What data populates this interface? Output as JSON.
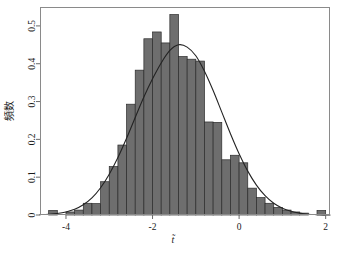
{
  "chart_data": {
    "type": "bar",
    "title": "",
    "subtitle": "",
    "xlabel": "t̃",
    "ylabel": "頻数",
    "xlim": [
      -4.6,
      2.1
    ],
    "ylim": [
      0,
      0.55
    ],
    "xticks": [
      -4,
      -2,
      0,
      2
    ],
    "xtick_labels": [
      "-4",
      "-2",
      "0",
      "2"
    ],
    "yticks": [
      0,
      0.1,
      0.2,
      0.3,
      0.4,
      0.5
    ],
    "ytick_labels": [
      "0",
      "0.1",
      "0.2",
      "0.3",
      "0.4",
      "0.5"
    ],
    "grid": false,
    "legend": "none",
    "bin_width": 0.2,
    "bar_color": "#6e6e6e",
    "bar_edge_color": "#2b2b2b",
    "curve_color": "#232323",
    "frame_color": "#8a8a8a",
    "categories": [
      "-4.4",
      "-4.2",
      "-4.0",
      "-3.8",
      "-3.6",
      "-3.4",
      "-3.2",
      "-3.0",
      "-2.8",
      "-2.6",
      "-2.4",
      "-2.2",
      "-2.0",
      "-1.8",
      "-1.6",
      "-1.4",
      "-1.2",
      "-1.0",
      "-0.8",
      "-0.6",
      "-0.4",
      "-0.2",
      "0.0",
      "0.2",
      "0.4",
      "0.6",
      "0.8",
      "1.0",
      "1.2",
      "1.4",
      "1.6",
      "1.8"
    ],
    "bin_left_edges": [
      -4.4,
      -4.2,
      -4.0,
      -3.8,
      -3.6,
      -3.4,
      -3.2,
      -3.0,
      -2.8,
      -2.6,
      -2.4,
      -2.2,
      -2.0,
      -1.8,
      -1.6,
      -1.4,
      -1.2,
      -1.0,
      -0.8,
      -0.6,
      -0.4,
      -0.2,
      0.0,
      0.2,
      0.4,
      0.6,
      0.8,
      1.0,
      1.2,
      1.4,
      1.6,
      1.8
    ],
    "values": [
      0.012,
      0.0,
      0.008,
      0.013,
      0.031,
      0.03,
      0.088,
      0.128,
      0.185,
      0.293,
      0.383,
      0.466,
      0.484,
      0.455,
      0.53,
      0.419,
      0.412,
      0.407,
      0.246,
      0.245,
      0.146,
      0.158,
      0.138,
      0.071,
      0.046,
      0.031,
      0.02,
      0.013,
      0.008,
      0.005,
      0.0,
      0.012
    ],
    "overlay_curve": {
      "name": "normal density fit",
      "type": "line",
      "mean": -1.55,
      "sd": 0.875,
      "peak_value": 0.456,
      "x": [
        -4.6,
        -4.4,
        -4.2,
        -4.0,
        -3.8,
        -3.6,
        -3.4,
        -3.2,
        -3.0,
        -2.8,
        -2.6,
        -2.4,
        -2.2,
        -2.0,
        -1.8,
        -1.6,
        -1.4,
        -1.2,
        -1.0,
        -0.8,
        -0.6,
        -0.4,
        -0.2,
        0.0,
        0.2,
        0.4,
        0.6,
        0.8,
        1.0,
        1.2,
        1.4,
        1.6,
        1.8,
        2.0,
        2.1
      ],
      "y": [
        0.001,
        0.002,
        0.004,
        0.008,
        0.015,
        0.027,
        0.045,
        0.072,
        0.108,
        0.152,
        0.203,
        0.258,
        0.312,
        0.36,
        0.402,
        0.435,
        0.45,
        0.444,
        0.421,
        0.38,
        0.329,
        0.272,
        0.215,
        0.162,
        0.116,
        0.079,
        0.051,
        0.031,
        0.018,
        0.01,
        0.005,
        0.002,
        0.001,
        0.0,
        0.0
      ]
    }
  },
  "plot_geometry": {
    "left": 40,
    "right": 330,
    "top": 7,
    "bottom": 215
  }
}
